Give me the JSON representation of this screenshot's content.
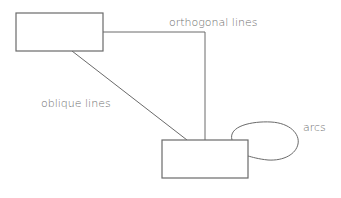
{
  "diagram": {
    "labels": {
      "orthogonal": "orthogonal lines",
      "oblique": "oblique lines",
      "arcs": "arcs"
    },
    "nodes": [
      {
        "id": "box-top-left",
        "x": 16,
        "y": 13,
        "w": 87,
        "h": 38
      },
      {
        "id": "box-bottom-right",
        "x": 162,
        "y": 140,
        "w": 86,
        "h": 38
      }
    ],
    "edges": [
      {
        "type": "orthogonal",
        "from": "box-top-left",
        "to": "box-bottom-right"
      },
      {
        "type": "oblique",
        "from": "box-top-left",
        "to": "box-bottom-right"
      },
      {
        "type": "arc",
        "from": "box-bottom-right",
        "to": "box-bottom-right"
      }
    ],
    "colors": {
      "stroke": "#6a6a6a",
      "text": "#6e6e6e",
      "background": "#ffffff"
    }
  }
}
